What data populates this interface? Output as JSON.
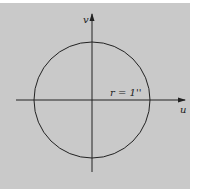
{
  "diagram": {
    "axes": {
      "horizontal_label": "u",
      "vertical_label": "v"
    },
    "circle": {
      "label": "r = 1''",
      "center": [
        92,
        100
      ],
      "radius": 58
    },
    "colors": {
      "background": "#c9c9c9",
      "stroke": "#222222"
    }
  }
}
